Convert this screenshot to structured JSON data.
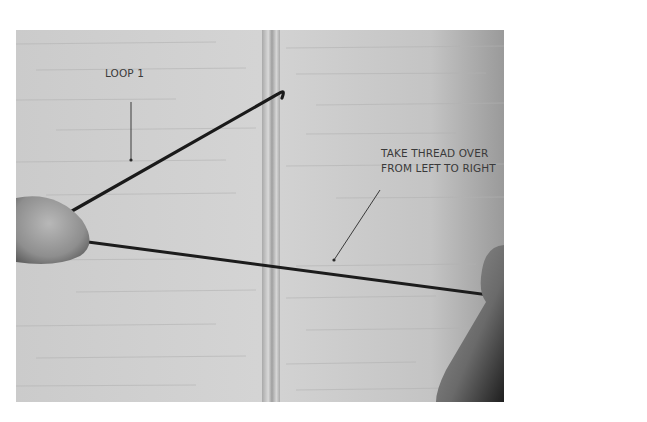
{
  "figure": {
    "colors": {
      "background": "#ffffff",
      "wood": "#cfcfcf",
      "thread": "#1a1a1a",
      "cord": "#bdbdbd",
      "label_text": "#3a3a3a"
    }
  },
  "annotations": {
    "loop_label": "LOOP 1",
    "instruction_line1": "TAKE THREAD OVER",
    "instruction_line2": "FROM LEFT TO RIGHT"
  }
}
